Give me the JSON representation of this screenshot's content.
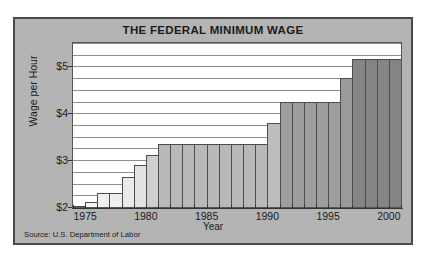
{
  "figure": {
    "title": "THE FEDERAL MINIMUM WAGE",
    "source": "Source: U.S. Department of Labor",
    "background_color": "#b4b4b4",
    "border_color": "#4a4a4a",
    "plot_background_color": "#ffffff",
    "gridline_color": "#8e8e8e"
  },
  "chart_data": {
    "type": "bar",
    "title": "THE FEDERAL MINIMUM WAGE",
    "xlabel": "Year",
    "ylabel": "Wage per Hour",
    "ylim": [
      2.0,
      5.5
    ],
    "ytick_values": [
      2,
      3,
      4,
      5
    ],
    "ytick_labels": [
      "$2",
      "$3",
      "$4",
      "$5"
    ],
    "grid": true,
    "grid_interval": 0.25,
    "legend": "none",
    "source": "Source: U.S. Department of Labor",
    "xtick_labels": [
      "1975",
      "1980",
      "1985",
      "1990",
      "1995",
      "2000"
    ],
    "xtick_values": [
      1975,
      1980,
      1985,
      1990,
      1995,
      2000
    ],
    "categories": [
      1974,
      1975,
      1976,
      1977,
      1978,
      1979,
      1980,
      1981,
      1982,
      1983,
      1984,
      1985,
      1986,
      1987,
      1988,
      1989,
      1990,
      1991,
      1992,
      1993,
      1994,
      1995,
      1996,
      1997,
      1998,
      1999,
      2000
    ],
    "values": [
      2.0,
      2.1,
      2.3,
      2.3,
      2.65,
      2.9,
      3.1,
      3.35,
      3.35,
      3.35,
      3.35,
      3.35,
      3.35,
      3.35,
      3.35,
      3.35,
      3.8,
      4.25,
      4.25,
      4.25,
      4.25,
      4.25,
      4.75,
      5.15,
      5.15,
      5.15,
      5.15
    ],
    "bar_colors": [
      "#f2f2f2",
      "#f2f2f2",
      "#efefef",
      "#efefef",
      "#eaeaea",
      "#e2e2e2",
      "#cfcfcf",
      "#b9b9b9",
      "#b9b9b9",
      "#b9b9b9",
      "#b9b9b9",
      "#b9b9b9",
      "#b9b9b9",
      "#b9b9b9",
      "#b9b9b9",
      "#b9b9b9",
      "#bdbdbd",
      "#9e9e9e",
      "#9e9e9e",
      "#9e9e9e",
      "#9e9e9e",
      "#9e9e9e",
      "#9a9a9a",
      "#848484",
      "#848484",
      "#848484",
      "#848484"
    ]
  }
}
